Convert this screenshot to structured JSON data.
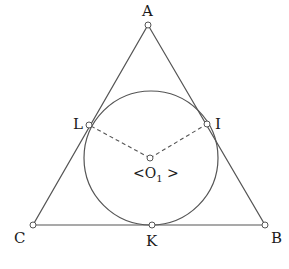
{
  "diagram": {
    "type": "geometry",
    "title": "",
    "stroke_color": "#555555",
    "point_fill": "#ffffff",
    "triangle": {
      "vertices": [
        "A",
        "B",
        "C"
      ]
    },
    "incircle": {
      "center_label": "<O",
      "center_subscript": "1",
      "center_label_suffix": " >"
    },
    "points": [
      {
        "id": "A",
        "label": "A"
      },
      {
        "id": "B",
        "label": "B"
      },
      {
        "id": "C",
        "label": "C"
      },
      {
        "id": "K",
        "label": "K"
      },
      {
        "id": "L",
        "label": "L"
      },
      {
        "id": "I",
        "label": "I"
      }
    ],
    "segments": [
      {
        "from": "A",
        "to": "B",
        "style": "solid"
      },
      {
        "from": "B",
        "to": "C",
        "style": "solid"
      },
      {
        "from": "C",
        "to": "A",
        "style": "solid"
      },
      {
        "from": "O1",
        "to": "L",
        "style": "dashed"
      },
      {
        "from": "O1",
        "to": "I",
        "style": "dashed"
      }
    ]
  }
}
